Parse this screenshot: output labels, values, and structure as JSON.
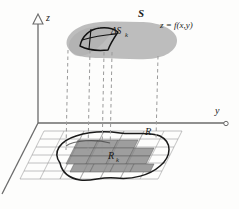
{
  "figure": {
    "caption_visible": false,
    "background_color": "#fdfdfc"
  },
  "axes": {
    "z_axis": {
      "label": "z",
      "direction": "up",
      "arrow": "open-triangle",
      "origin": [
        38,
        123
      ],
      "tip": [
        38,
        14
      ],
      "label_pos": [
        47,
        17
      ]
    },
    "y_axis": {
      "label": "y",
      "direction": "right",
      "arrow": "open-circle",
      "origin": [
        38,
        123
      ],
      "tip": [
        226,
        123
      ],
      "label_pos": [
        215,
        108
      ]
    },
    "x_axis": {
      "label": "",
      "direction": "down-left",
      "origin": [
        38,
        123
      ],
      "tip": [
        2,
        193
      ]
    },
    "axis_color": "#6b6b6b"
  },
  "surface": {
    "name": "S",
    "label": "S",
    "label_pos": [
      140,
      14
    ],
    "equation_label": "z = f(x,y)",
    "equation_pos": [
      162,
      26
    ],
    "fill_color": "#b9b9b9",
    "patch": {
      "label": "ΔSₖ",
      "label_text": "ΔS",
      "label_sub": "k",
      "label_pos": [
        112,
        32
      ],
      "outline_color": "#111111"
    }
  },
  "region": {
    "name": "R",
    "label": "R",
    "label_pos": [
      146,
      131
    ],
    "outline_color": "#1a1a1a",
    "subrectangle": {
      "label": "R",
      "label_sub": "k",
      "label_pos": [
        110,
        156
      ]
    },
    "cell_fill_color": "#9e9e9e",
    "grid_color": "#8e8e8e"
  },
  "projection_lines": {
    "style": "dashed",
    "color": "#9a9a9a",
    "count": 5
  },
  "colors": {
    "surface_gray": "#b9b9b9",
    "cell_gray": "#9e9e9e",
    "grid_gray": "#8e8e8e",
    "ink": "#1a1a1a",
    "dash_gray": "#9a9a9a"
  }
}
